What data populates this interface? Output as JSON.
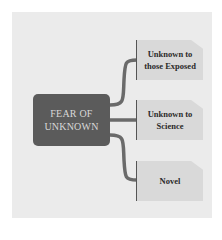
{
  "diagram": {
    "center": {
      "label": "FEAR OF\nUNKNOWN",
      "color": "#5b5b5b"
    },
    "branches": [
      {
        "label": "Unknown to\nthose Exposed"
      },
      {
        "label": "Unknown to\nScience"
      },
      {
        "label": "Novel"
      }
    ],
    "colors": {
      "background": "#ebebeb",
      "node": "#d9d9d9",
      "connector": "#6a6a6a"
    }
  }
}
